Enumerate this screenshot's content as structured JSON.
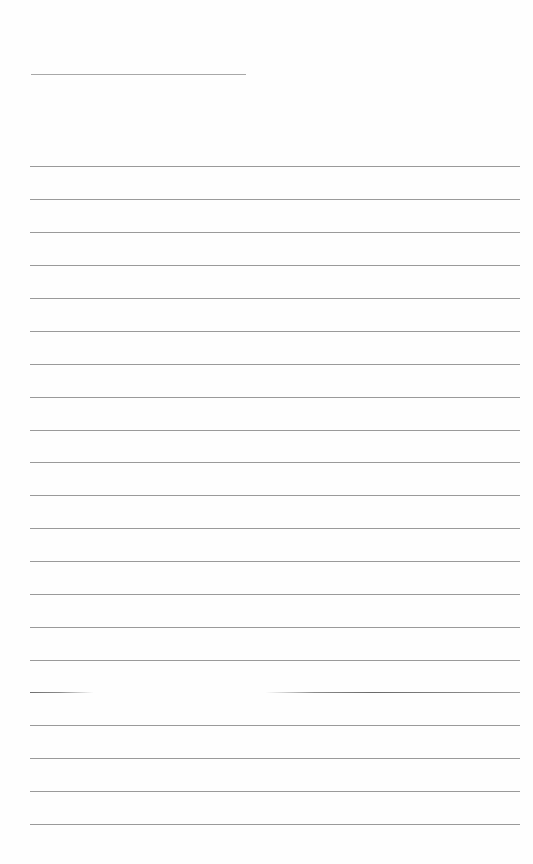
{
  "page": {
    "type": "lined-paper",
    "background": "#fefefe",
    "line_color": "#9a9a9a",
    "title_line": {
      "x": 31,
      "y": 74,
      "width": 215
    },
    "ruled_lines": {
      "count": 20,
      "x": 30,
      "width": 490,
      "y_positions": [
        166,
        199,
        232,
        265,
        298,
        331,
        364,
        397,
        430,
        462,
        495,
        528,
        561,
        594,
        627,
        660,
        692,
        725,
        758,
        791,
        824
      ],
      "faded_line_index": 16
    }
  }
}
